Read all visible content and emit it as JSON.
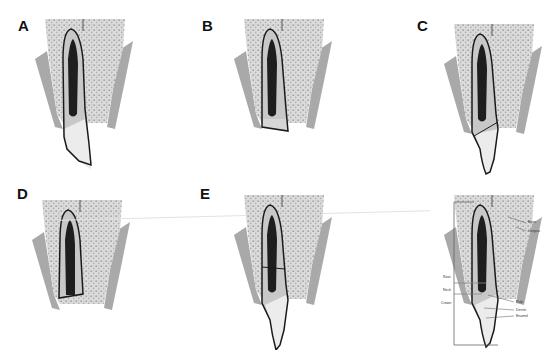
{
  "figure": {
    "panels": [
      {
        "id": "A",
        "letter": "A",
        "fracture": "crown fracture (oblique, enamel/dentin, no pulp)"
      },
      {
        "id": "B",
        "letter": "B",
        "fracture": "horizontal crown fracture"
      },
      {
        "id": "C",
        "letter": "C",
        "fracture": "oblique crown-root fracture"
      },
      {
        "id": "D",
        "letter": "D",
        "fracture": "horizontal fracture at cervical level"
      },
      {
        "id": "E",
        "letter": "E",
        "fracture": "horizontal root fracture"
      },
      {
        "id": "F",
        "letter": "",
        "fracture": "normal anatomy (labeled)"
      }
    ],
    "anatomy_labels": {
      "bone": "Bone",
      "gingiva": "Gingiva",
      "root": "Root",
      "neck": "Neck",
      "crown": "Crown",
      "pulp": "Pulp",
      "dentin": "Dentin",
      "enamel": "Enamel"
    },
    "colors": {
      "bone": "#d9d9d9",
      "bone_dots": "#a8a8a8",
      "gingiva": "#a9a9a9",
      "dentin": "#c8c8c8",
      "pulp": "#1e1e1e",
      "enamel": "#ececec",
      "outline": "#1a1a1a"
    }
  }
}
